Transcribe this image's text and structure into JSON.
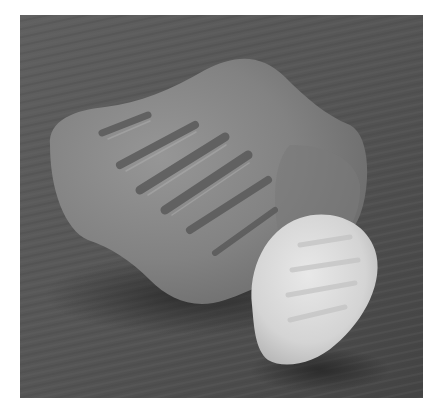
{
  "image": {
    "alt": "Two pieces of frosted sea glass with parallel ridges resting on a dark textured slate surface",
    "subjects": [
      {
        "name": "large sea glass",
        "shade": "medium gray",
        "feature": "ribbed grooves"
      },
      {
        "name": "small sea glass",
        "shade": "pale white",
        "feature": "faint ribs"
      }
    ],
    "background": "dark gray slate",
    "colors": {
      "border": "#ffffff",
      "slate": "#575757",
      "slate_dark": "#3e3e3e",
      "large_glass": "#8a8a8a",
      "large_glass_dark": "#6a6a6a",
      "small_glass": "#d6d6d6",
      "small_glass_light": "#e6e6e6"
    }
  }
}
